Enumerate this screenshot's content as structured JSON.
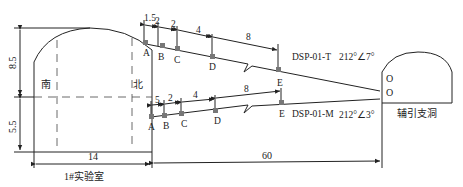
{
  "diagram": {
    "left_chamber": {
      "name": "1#实验室",
      "side_south": "南",
      "side_north": "北",
      "height_upper": "8.5",
      "height_lower": "5.5",
      "width": "14"
    },
    "right_chamber": {
      "name": "辅引支洞",
      "outlet_upper": "O",
      "outlet_lower": "O"
    },
    "distance_between": "60",
    "boreholes": [
      {
        "id": "DSP-01-T",
        "orientation": "212°∠7°",
        "points": [
          "A",
          "B",
          "C",
          "D",
          "E"
        ],
        "spacings": [
          "1.5",
          "2",
          "2",
          "4",
          "8"
        ]
      },
      {
        "id": "DSP-01-M",
        "orientation": "212°∠3°",
        "points": [
          "A",
          "B",
          "C",
          "D",
          "E"
        ],
        "spacings": [
          "5",
          "2",
          "4",
          "8"
        ]
      }
    ]
  }
}
